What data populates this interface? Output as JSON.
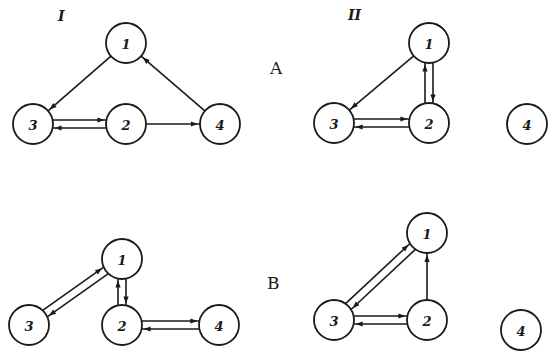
{
  "column_labels": [
    {
      "text": "I",
      "x": 62,
      "y": 10
    },
    {
      "text": "II",
      "x": 353,
      "y": 9
    }
  ],
  "row_labels": [
    {
      "text": "A",
      "x": 271,
      "y": 57
    },
    {
      "text": "B",
      "x": 268,
      "y": 272
    }
  ],
  "colors": {
    "stroke": "#1a1a1a",
    "background": "#ffffff"
  },
  "node_radius": 20,
  "panels": [
    {
      "id": "A-I",
      "nodes": [
        {
          "id": "1",
          "label": "1",
          "x": 126,
          "y": 43
        },
        {
          "id": "2",
          "label": "2",
          "x": 126,
          "y": 124
        },
        {
          "id": "3",
          "label": "3",
          "x": 33,
          "y": 124
        },
        {
          "id": "4",
          "label": "4",
          "x": 220,
          "y": 124
        }
      ],
      "edges": [
        {
          "from": "1",
          "to": "3",
          "offset": 0
        },
        {
          "from": "3",
          "to": "2",
          "offset": -4
        },
        {
          "from": "2",
          "to": "3",
          "offset": -4
        },
        {
          "from": "2",
          "to": "4",
          "offset": 0
        },
        {
          "from": "4",
          "to": "1",
          "offset": 0
        }
      ]
    },
    {
      "id": "A-II",
      "nodes": [
        {
          "id": "1",
          "label": "1",
          "x": 429,
          "y": 43
        },
        {
          "id": "2",
          "label": "2",
          "x": 429,
          "y": 123
        },
        {
          "id": "3",
          "label": "3",
          "x": 334,
          "y": 123
        },
        {
          "id": "4",
          "label": "4",
          "x": 527,
          "y": 124
        }
      ],
      "edges": [
        {
          "from": "1",
          "to": "3",
          "offset": 0
        },
        {
          "from": "1",
          "to": "2",
          "offset": -4
        },
        {
          "from": "2",
          "to": "1",
          "offset": -4
        },
        {
          "from": "3",
          "to": "2",
          "offset": -4
        },
        {
          "from": "2",
          "to": "3",
          "offset": -4
        }
      ]
    },
    {
      "id": "B-I",
      "nodes": [
        {
          "id": "1",
          "label": "1",
          "x": 122,
          "y": 259
        },
        {
          "id": "2",
          "label": "2",
          "x": 122,
          "y": 325
        },
        {
          "id": "3",
          "label": "3",
          "x": 29,
          "y": 325
        },
        {
          "id": "4",
          "label": "4",
          "x": 219,
          "y": 325
        }
      ],
      "edges": [
        {
          "from": "1",
          "to": "3",
          "offset": -4
        },
        {
          "from": "3",
          "to": "1",
          "offset": -4
        },
        {
          "from": "1",
          "to": "2",
          "offset": -4
        },
        {
          "from": "2",
          "to": "1",
          "offset": -4
        },
        {
          "from": "2",
          "to": "4",
          "offset": -4
        },
        {
          "from": "4",
          "to": "2",
          "offset": -4
        }
      ]
    },
    {
      "id": "B-II",
      "nodes": [
        {
          "id": "1",
          "label": "1",
          "x": 427,
          "y": 233
        },
        {
          "id": "2",
          "label": "2",
          "x": 427,
          "y": 320
        },
        {
          "id": "3",
          "label": "3",
          "x": 334,
          "y": 320
        },
        {
          "id": "4",
          "label": "4",
          "x": 521,
          "y": 330
        }
      ],
      "edges": [
        {
          "from": "1",
          "to": "3",
          "offset": -4
        },
        {
          "from": "3",
          "to": "1",
          "offset": -4
        },
        {
          "from": "2",
          "to": "1",
          "offset": 0
        },
        {
          "from": "3",
          "to": "2",
          "offset": -4
        },
        {
          "from": "2",
          "to": "3",
          "offset": -4
        }
      ]
    }
  ]
}
